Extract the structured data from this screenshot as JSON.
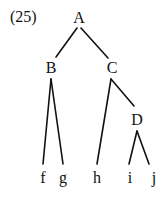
{
  "example_number": "(25)",
  "tree": {
    "nodes": [
      {
        "id": "A",
        "label": "A"
      },
      {
        "id": "B",
        "label": "B"
      },
      {
        "id": "C",
        "label": "C"
      },
      {
        "id": "D",
        "label": "D"
      },
      {
        "id": "f",
        "label": "f"
      },
      {
        "id": "g",
        "label": "g"
      },
      {
        "id": "h",
        "label": "h"
      },
      {
        "id": "i",
        "label": "i"
      },
      {
        "id": "j",
        "label": "j"
      }
    ],
    "edges": [
      {
        "from": "A",
        "to": "B"
      },
      {
        "from": "A",
        "to": "C"
      },
      {
        "from": "B",
        "to": "f"
      },
      {
        "from": "B",
        "to": "g"
      },
      {
        "from": "C",
        "to": "h"
      },
      {
        "from": "C",
        "to": "D"
      },
      {
        "from": "D",
        "to": "i"
      },
      {
        "from": "D",
        "to": "j"
      }
    ]
  }
}
